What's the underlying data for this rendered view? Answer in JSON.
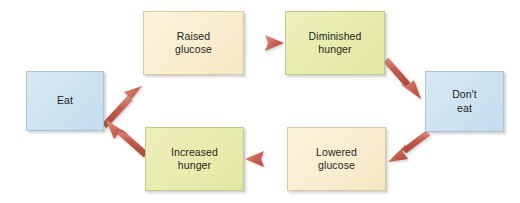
{
  "diagram": {
    "type": "cycle-flowchart",
    "background_color": "#ffffff",
    "arrow_color": "#c35a4c",
    "colors": {
      "blue": "#cee3f1",
      "cream": "#f9eed0",
      "olive": "#e8ecae",
      "text": "#231f20"
    },
    "nodes": [
      {
        "id": "eat",
        "label_line1": "Eat",
        "label_line2": "",
        "color_name": "blue",
        "x": 26,
        "y": 71,
        "w": 78,
        "h": 60
      },
      {
        "id": "raised-glucose",
        "label_line1": "Raised",
        "label_line2": "glucose",
        "color_name": "cream",
        "x": 143,
        "y": 11,
        "w": 101,
        "h": 64
      },
      {
        "id": "diminished-hunger",
        "label_line1": "Diminished",
        "label_line2": "hunger",
        "color_name": "olive",
        "x": 285,
        "y": 11,
        "w": 100,
        "h": 64
      },
      {
        "id": "dont-eat",
        "label_line1": "Don't",
        "label_line2": "eat",
        "color_name": "blue",
        "x": 425,
        "y": 71,
        "w": 79,
        "h": 61
      },
      {
        "id": "lowered-glucose",
        "label_line1": "Lowered",
        "label_line2": "glucose",
        "color_name": "cream",
        "x": 287,
        "y": 127,
        "w": 99,
        "h": 64
      },
      {
        "id": "increased-hunger",
        "label_line1": "Increased",
        "label_line2": "hunger",
        "color_name": "olive",
        "x": 145,
        "y": 127,
        "w": 99,
        "h": 64
      }
    ],
    "arrows": [
      {
        "id": "eat-to-raised-glucose",
        "from": "eat",
        "to": "raised-glucose",
        "direction": "up-right"
      },
      {
        "id": "raised-glucose-to-diminished-hunger",
        "from": "raised-glucose",
        "to": "diminished-hunger",
        "direction": "right"
      },
      {
        "id": "diminished-hunger-to-dont-eat",
        "from": "diminished-hunger",
        "to": "dont-eat",
        "direction": "down-right"
      },
      {
        "id": "dont-eat-to-lowered-glucose",
        "from": "dont-eat",
        "to": "lowered-glucose",
        "direction": "down-left"
      },
      {
        "id": "lowered-glucose-to-increased-hunger",
        "from": "lowered-glucose",
        "to": "increased-hunger",
        "direction": "left"
      },
      {
        "id": "increased-hunger-to-eat",
        "from": "increased-hunger",
        "to": "eat",
        "direction": "up-left"
      }
    ]
  }
}
